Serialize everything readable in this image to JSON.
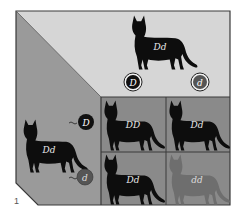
{
  "figure": {
    "label": "1"
  },
  "colors": {
    "top_panel": "#d6d6d6",
    "left_panel": "#9a9a9a",
    "grid_bg": "#8a8a8a",
    "frame": "#3a3a3a",
    "dark_cat": "#0d0d0d",
    "dilute_cat": "#6e6e6e",
    "allele_D_fill": "#111111",
    "allele_d_fill": "#555555"
  },
  "top_parent": {
    "genotype": "Dd",
    "gametes": [
      {
        "allele": "D",
        "style": "dark"
      },
      {
        "allele": "d",
        "style": "dilute"
      }
    ]
  },
  "left_parent": {
    "genotype": "Dd",
    "gametes": [
      {
        "allele": "D",
        "style": "dark"
      },
      {
        "allele": "d",
        "style": "dilute"
      }
    ]
  },
  "grid": {
    "cells": [
      {
        "row": 0,
        "col": 0,
        "genotype": "DD",
        "phenotype": "dark"
      },
      {
        "row": 0,
        "col": 1,
        "genotype": "Dd",
        "phenotype": "dark"
      },
      {
        "row": 1,
        "col": 0,
        "genotype": "Dd",
        "phenotype": "dark"
      },
      {
        "row": 1,
        "col": 1,
        "genotype": "dd",
        "phenotype": "dilute"
      }
    ]
  }
}
